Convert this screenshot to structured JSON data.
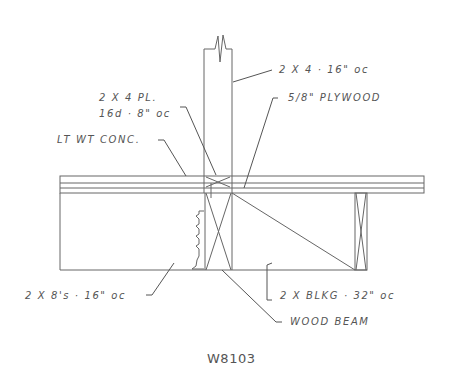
{
  "drawing": {
    "id": "W8103",
    "labels": {
      "stud": "2 X 4 · 16\" oc",
      "plate_line1": "2 X 4 PL.",
      "plate_line2": "16d · 8\" oc",
      "plywood": "5/8\" PLYWOOD",
      "concrete": "LT WT CONC.",
      "joists": "2 X 8's · 16\" oc",
      "blocking": "2 X BLKG · 32\" oc",
      "beam": "WOOD BEAM"
    },
    "colors": {
      "line": "#555555",
      "background": "#ffffff"
    }
  }
}
